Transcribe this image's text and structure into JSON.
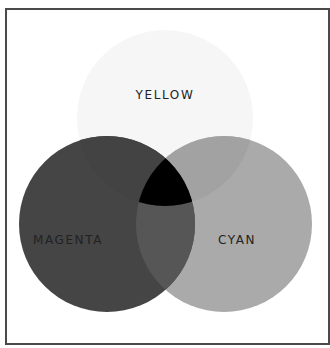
{
  "diagram": {
    "type": "venn",
    "sets": [
      {
        "id": "yellow",
        "label": "YELLOW",
        "cx": 165,
        "cy": 118,
        "r": 88,
        "fill": "#f6f6f6"
      },
      {
        "id": "magenta",
        "label": "MAGENTA",
        "cx": 107,
        "cy": 224,
        "r": 88,
        "fill": "#454545"
      },
      {
        "id": "cyan",
        "label": "CYAN",
        "cx": 224,
        "cy": 224,
        "r": 88,
        "fill": "#aaaaaa"
      }
    ],
    "overlaps": {
      "yellow_cyan": "#a2a2a2",
      "yellow_magenta": "#434343",
      "magenta_cyan": "#565656",
      "all_three": "#000000"
    },
    "frame_color": "#4a4a4a"
  }
}
